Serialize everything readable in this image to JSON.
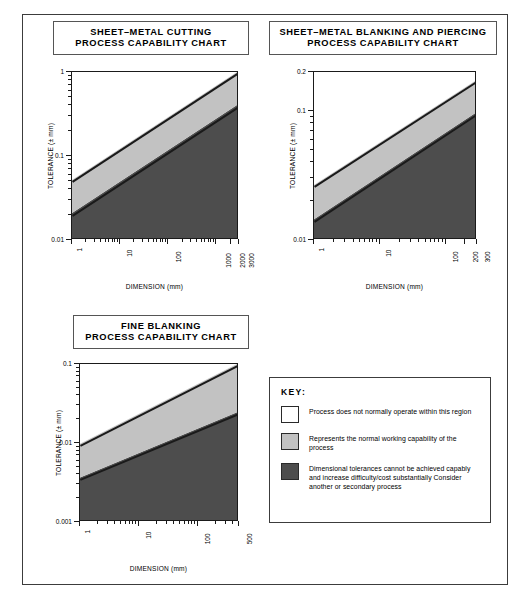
{
  "document": {
    "title": "Process Capability Charts"
  },
  "colors": {
    "region_white": "#ffffff",
    "region_light_grey": "#c2c2c2",
    "region_dark_grey": "#4d4d4d",
    "line": "#1a1a1a",
    "border": "#3c3c3c"
  },
  "key": {
    "heading": "KEY:",
    "items": [
      {
        "swatch": "white",
        "color": "#ffffff",
        "text": "Process does not normally operate within this region"
      },
      {
        "swatch": "light-grey",
        "color": "#c2c2c2",
        "text": "Represents the normal working capability of the process"
      },
      {
        "swatch": "dark-grey",
        "color": "#4d4d4d",
        "text": "Dimensional tolerances cannot be achieved capably and increase difficulty/cost substantially Consider another or secondary process"
      }
    ]
  },
  "chart_data": [
    {
      "id": "sheet-metal-cutting",
      "type": "area",
      "title": "SHEET–METAL CUTTING PROCESS CAPABILITY CHART",
      "title_lines": [
        "SHEET–METAL CUTTING",
        "PROCESS CAPABILITY CHART"
      ],
      "xlabel": "DIMENSION (mm)",
      "ylabel": "TOLERANCE (± mm)",
      "xscale": "log",
      "yscale": "log",
      "xlim": [
        1,
        3000
      ],
      "ylim": [
        0.01,
        1
      ],
      "grid": false,
      "xticks": [
        1,
        10,
        100,
        1000,
        2000,
        3000
      ],
      "xticklabels": [
        "1",
        "10",
        "100",
        "1000",
        "2000",
        "3000"
      ],
      "yticks": [
        0.01,
        0.1,
        1
      ],
      "yticklabels": [
        "0.01",
        "0.1",
        "1"
      ],
      "series": [
        {
          "name": "upper boundary (white / normal-capability)",
          "x": [
            1,
            3000
          ],
          "y": [
            0.05,
            1.0
          ]
        },
        {
          "name": "lower boundary (normal-capability / difficult)",
          "x": [
            1,
            3000
          ],
          "y": [
            0.02,
            0.4
          ]
        }
      ]
    },
    {
      "id": "sheet-metal-blanking-and-piercing",
      "type": "area",
      "title": "SHEET–METAL BLANKING AND PIERCING PROCESS CAPABILITY CHART",
      "title_lines": [
        "SHEET–METAL BLANKING AND PIERCING",
        "PROCESS CAPABILITY CHART"
      ],
      "xlabel": "DIMENSION (mm)",
      "ylabel": "TOLERANCE (± mm)",
      "xscale": "log",
      "yscale": "log",
      "xlim": [
        1,
        300
      ],
      "ylim": [
        0.01,
        0.2
      ],
      "grid": false,
      "xticks": [
        1,
        10,
        100,
        200,
        300
      ],
      "xticklabels": [
        "1",
        "10",
        "100",
        "200",
        "300"
      ],
      "yticks": [
        0.01,
        0.1,
        0.2
      ],
      "yticklabels": [
        "0.01",
        "0.1",
        "0.2"
      ],
      "series": [
        {
          "name": "upper boundary (white / normal-capability)",
          "x": [
            1,
            300
          ],
          "y": [
            0.026,
            0.17
          ]
        },
        {
          "name": "lower boundary (normal-capability / difficult)",
          "x": [
            1,
            300
          ],
          "y": [
            0.014,
            0.095
          ]
        }
      ]
    },
    {
      "id": "fine-blanking",
      "type": "area",
      "title": "FINE BLANKING PROCESS CAPABILITY CHART",
      "title_lines": [
        "FINE BLANKING",
        "PROCESS CAPABILITY CHART"
      ],
      "xlabel": "DIMENSION (mm)",
      "ylabel": "TOLERANCE (± mm)",
      "xscale": "log",
      "yscale": "log",
      "xlim": [
        1,
        500
      ],
      "ylim": [
        0.001,
        0.1
      ],
      "grid": false,
      "xticks": [
        1,
        10,
        100,
        500
      ],
      "xticklabels": [
        "1",
        "10",
        "100",
        "500"
      ],
      "yticks": [
        0.001,
        0.01,
        0.1
      ],
      "yticklabels": [
        "0.001",
        "0.01",
        "0.1"
      ],
      "series": [
        {
          "name": "upper boundary (white / normal-capability)",
          "x": [
            1,
            500
          ],
          "y": [
            0.0095,
            0.1
          ]
        },
        {
          "name": "lower boundary (normal-capability / difficult)",
          "x": [
            1,
            500
          ],
          "y": [
            0.0035,
            0.024
          ]
        }
      ]
    }
  ]
}
